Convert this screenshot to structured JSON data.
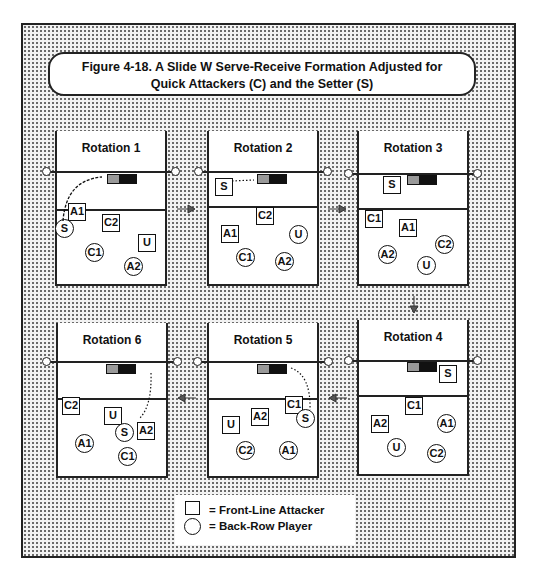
{
  "title": {
    "line1": "Figure 4-18.  A  Slide W Serve-Receive Formation Adjusted for",
    "line2": "Quick Attackers (C) and  the Setter (S)"
  },
  "rotations": [
    {
      "label": "Rotation 1",
      "players": [
        {
          "id": "A1",
          "shape": "square"
        },
        {
          "id": "C2",
          "shape": "square"
        },
        {
          "id": "U",
          "shape": "square"
        },
        {
          "id": "S",
          "shape": "circle"
        },
        {
          "id": "C1",
          "shape": "circle"
        },
        {
          "id": "A2",
          "shape": "circle"
        }
      ]
    },
    {
      "label": "Rotation 2",
      "players": [
        {
          "id": "S",
          "shape": "square"
        },
        {
          "id": "C2",
          "shape": "square"
        },
        {
          "id": "A1",
          "shape": "square"
        },
        {
          "id": "U",
          "shape": "circle"
        },
        {
          "id": "C1",
          "shape": "circle"
        },
        {
          "id": "A2",
          "shape": "circle"
        }
      ]
    },
    {
      "label": "Rotation 3",
      "players": [
        {
          "id": "S",
          "shape": "square"
        },
        {
          "id": "C1",
          "shape": "square"
        },
        {
          "id": "A1",
          "shape": "square"
        },
        {
          "id": "C2",
          "shape": "circle"
        },
        {
          "id": "A2",
          "shape": "circle"
        },
        {
          "id": "U",
          "shape": "circle"
        }
      ]
    },
    {
      "label": "Rotation 4",
      "players": [
        {
          "id": "S",
          "shape": "square"
        },
        {
          "id": "C1",
          "shape": "square"
        },
        {
          "id": "A2",
          "shape": "square"
        },
        {
          "id": "A1",
          "shape": "circle"
        },
        {
          "id": "U",
          "shape": "circle"
        },
        {
          "id": "C2",
          "shape": "circle"
        }
      ]
    },
    {
      "label": "Rotation 5",
      "players": [
        {
          "id": "C1",
          "shape": "square"
        },
        {
          "id": "A2",
          "shape": "square"
        },
        {
          "id": "U",
          "shape": "square"
        },
        {
          "id": "S",
          "shape": "circle"
        },
        {
          "id": "C2",
          "shape": "circle"
        },
        {
          "id": "A1",
          "shape": "circle"
        }
      ]
    },
    {
      "label": "Rotation 6",
      "players": [
        {
          "id": "C2",
          "shape": "square"
        },
        {
          "id": "U",
          "shape": "square"
        },
        {
          "id": "A2",
          "shape": "square"
        },
        {
          "id": "S",
          "shape": "circle"
        },
        {
          "id": "A1",
          "shape": "circle"
        },
        {
          "id": "C1",
          "shape": "circle"
        }
      ]
    }
  ],
  "legend": {
    "square": "= Front-Line Attacker",
    "circle": "= Back-Row Player"
  },
  "colors": {
    "ink": "#111111",
    "background_dots": "#6a6a6a",
    "setter_zone_light": "#999999",
    "setter_zone_dark": "#111111"
  }
}
